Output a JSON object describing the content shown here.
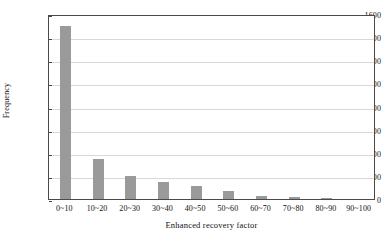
{
  "chart_data": {
    "type": "bar",
    "title": "",
    "subtitle": "",
    "xlabel": "Enhanced recovery factor",
    "ylabel": "Frequency",
    "categories": [
      "0~10",
      "10~20",
      "20~30",
      "30~40",
      "40~50",
      "50~60",
      "60~70",
      "70~80",
      "80~90",
      "90~100"
    ],
    "values": [
      1500,
      350,
      195,
      150,
      115,
      70,
      30,
      20,
      10,
      0
    ],
    "ylim": [
      0,
      1600
    ],
    "ytick_labels": [
      "0",
      "200",
      "400",
      "600",
      "800",
      "1000",
      "1200",
      "1400",
      "1600"
    ],
    "ytick_values": [
      0,
      200,
      400,
      600,
      800,
      1000,
      1200,
      1400,
      1600
    ],
    "grid": true,
    "grid_axis": "y",
    "legend": false,
    "legend_position": "none",
    "bar_color": "#9a9a9a",
    "grid_color": "#d8d8d8",
    "axis_color": "#4a4a4a",
    "background_color": "#ffffff",
    "text_color": "#111111"
  }
}
